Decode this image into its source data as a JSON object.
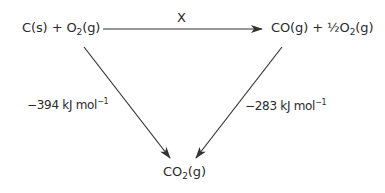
{
  "diagram": {
    "type": "hess-cycle",
    "nodes": {
      "reactants": {
        "parts": [
          "C(s) + O",
          "2",
          "(g)"
        ],
        "text": "C(s) + O2(g)"
      },
      "intermediate": {
        "parts": [
          "CO(g) + ½O",
          "2",
          "(g)"
        ],
        "text": "CO(g) + ½O2(g)"
      },
      "product": {
        "parts": [
          "CO",
          "2",
          "(g)"
        ],
        "text": "CO2(g)"
      }
    },
    "edges": {
      "top": {
        "from": "reactants",
        "to": "intermediate",
        "label": "X"
      },
      "left": {
        "from": "reactants",
        "to": "product",
        "value": "−394",
        "unit": "kJ mol",
        "exp": "−1",
        "text": "−394 kJ mol−1"
      },
      "right": {
        "from": "intermediate",
        "to": "product",
        "value": "−283",
        "unit": "kJ mol",
        "exp": "−1",
        "text": "−283 kJ mol−1"
      }
    },
    "colors": {
      "line": "#333333",
      "text": "#2a2a2a",
      "background": "#ffffff"
    }
  }
}
